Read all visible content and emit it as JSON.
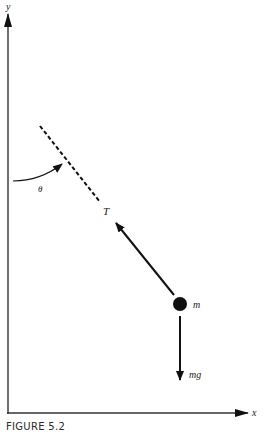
{
  "figure": {
    "caption": "FIGURE 5.2",
    "axes": {
      "x_label": "x",
      "y_label": "y"
    },
    "labels": {
      "angle": "θ",
      "tension": "T",
      "mass": "m",
      "weight": "mg"
    },
    "elements": [
      {
        "type": "axis",
        "name": "y-axis",
        "direction": "up"
      },
      {
        "type": "axis",
        "name": "x-axis",
        "direction": "right"
      },
      {
        "type": "dashed-line",
        "name": "pendulum-string-reference"
      },
      {
        "type": "curved-arrow",
        "name": "angle-theta",
        "label": "θ"
      },
      {
        "type": "arrow",
        "name": "tension-vector",
        "label": "T"
      },
      {
        "type": "point-mass",
        "name": "bob",
        "label": "m"
      },
      {
        "type": "arrow",
        "name": "gravity-vector",
        "label": "mg"
      }
    ],
    "colors": {
      "ink": "#111111",
      "axis": "#333333",
      "background": "#ffffff"
    }
  }
}
